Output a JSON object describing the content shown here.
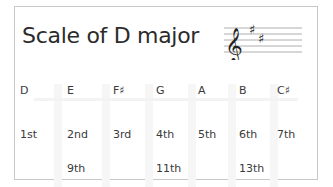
{
  "title": "Scale of D major",
  "key_signature": {
    "clef": "treble",
    "sharps": [
      "F♯",
      "C♯"
    ]
  },
  "columns": [
    {
      "note": "D",
      "degree": "1st",
      "extension": ""
    },
    {
      "note": "E",
      "degree": "2nd",
      "extension": "9th"
    },
    {
      "note": "F♯",
      "degree": "3rd",
      "extension": ""
    },
    {
      "note": "G",
      "degree": "4th",
      "extension": "11th"
    },
    {
      "note": "A",
      "degree": "5th",
      "extension": ""
    },
    {
      "note": "B",
      "degree": "6th",
      "extension": "13th"
    },
    {
      "note": "C♯",
      "degree": "7th",
      "extension": ""
    }
  ],
  "colors": {
    "border": "#c8c8c8",
    "text": "#2b2b2b",
    "column_shade": "#f6f6f6"
  }
}
